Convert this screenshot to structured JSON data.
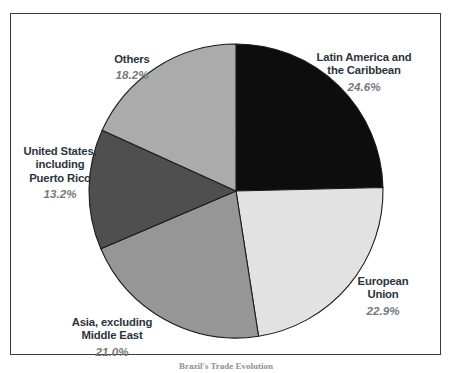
{
  "figure": {
    "background_color": "#ffffff",
    "border_color": "#3a3a3a",
    "caption": "Brazil's Trade Evolution"
  },
  "chart_data": {
    "type": "pie",
    "title": "",
    "subtitle": "",
    "xlabel": "",
    "ylabel": "",
    "grid": false,
    "legend_position": "outside-labels",
    "start_angle_deg": 0,
    "direction": "clockwise",
    "units": "percent",
    "categories": [
      "Latin America and\nthe Caribbean",
      "European\nUnion",
      "Asia, excluding\nMiddle East",
      "United States,\nincluding\nPuerto Rico",
      "Others"
    ],
    "values": [
      24.6,
      22.9,
      21.0,
      13.2,
      18.2
    ],
    "value_labels": [
      "24.6%",
      "22.9%",
      "21.0%",
      "13.2%",
      "18.2%"
    ],
    "colors": [
      "#0d0d0d",
      "#e2e2e2",
      "#969696",
      "#4f4f4f",
      "#ababab"
    ],
    "slices": [
      {
        "name": "latin-america-caribbean",
        "label": "Latin America and\nthe Caribbean",
        "value": 24.6,
        "value_label": "24.6%",
        "color": "#0d0d0d"
      },
      {
        "name": "european-union",
        "label": "European\nUnion",
        "value": 22.9,
        "value_label": "22.9%",
        "color": "#e2e2e2"
      },
      {
        "name": "asia-excluding-middle-east",
        "label": "Asia, excluding\nMiddle East",
        "value": 21.0,
        "value_label": "21.0%",
        "color": "#969696"
      },
      {
        "name": "united-states-including-puerto-rico",
        "label": "United States,\nincluding\nPuerto Rico",
        "value": 13.2,
        "value_label": "13.2%",
        "color": "#4f4f4f"
      },
      {
        "name": "others",
        "label": "Others",
        "value": 18.2,
        "value_label": "18.2%",
        "color": "#ababab"
      }
    ]
  }
}
